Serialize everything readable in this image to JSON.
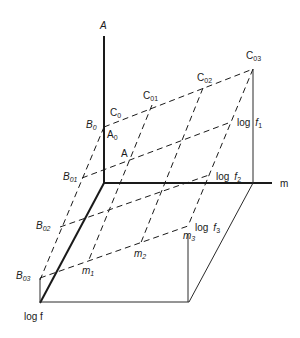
{
  "title": "",
  "axes": {
    "vertical": {
      "label": "A"
    },
    "horizontal": {
      "label": "m"
    },
    "depth": {
      "label": "log f"
    }
  },
  "labels": {
    "A": {
      "main": "A",
      "sub": ""
    },
    "C0": {
      "main": "C",
      "sub": "0"
    },
    "A0": {
      "main": "A",
      "sub": "0"
    },
    "B0": {
      "main": "B",
      "sub": "0"
    },
    "C01": {
      "main": "C",
      "sub": "01"
    },
    "C02": {
      "main": "C",
      "sub": "02"
    },
    "C03": {
      "main": "C",
      "sub": "03"
    },
    "B01": {
      "main": "B",
      "sub": "01"
    },
    "B02": {
      "main": "B",
      "sub": "02"
    },
    "B03": {
      "main": "B",
      "sub": "03"
    },
    "m1": {
      "main": "m",
      "sub": "1"
    },
    "m2": {
      "main": "m",
      "sub": "2"
    },
    "m3": {
      "main": "m",
      "sub": "3"
    },
    "logf1": {
      "prefix": "log",
      "main": "f",
      "sub": "1"
    },
    "logf2": {
      "prefix": "log",
      "main": "f",
      "sub": "2"
    },
    "logf3": {
      "prefix": "log",
      "main": "f",
      "sub": "3"
    },
    "point_A": {
      "main": "A"
    }
  }
}
